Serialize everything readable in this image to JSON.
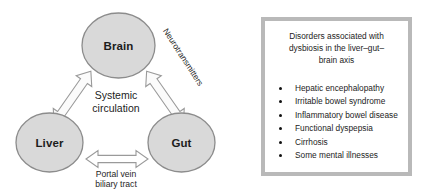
{
  "figure": {
    "diagram": {
      "nodes": [
        {
          "id": "brain",
          "label": "Brain"
        },
        {
          "id": "liver",
          "label": "Liver"
        },
        {
          "id": "gut",
          "label": "Gut"
        }
      ],
      "center_label": {
        "line1": "Systemic",
        "line2": "circulation"
      },
      "edges": [
        {
          "id": "brain-gut",
          "label": "Neurotransmitters",
          "style": "double-headed-block-arrow"
        },
        {
          "id": "liver-gut",
          "label_line1": "Portal vein",
          "label_line2": "biliary tract",
          "style": "double-headed-block-arrow"
        },
        {
          "id": "liver-brain",
          "label": "",
          "style": "double-headed-block-arrow"
        }
      ],
      "colors": {
        "node_fill": "#d9d9d9",
        "node_stroke": "#8c8c8c",
        "arrow_fill": "#fbfbfb",
        "arrow_stroke": "#9a9a9a",
        "text": "#1c1c1c"
      }
    },
    "panel": {
      "title": "Disorders associated with dysbiosis in the liver–gut–brain axis",
      "title_lines": [
        "Disorders associated with",
        "dysbiosis in the liver–gut–",
        "brain axis"
      ],
      "items": [
        "Hepatic encephalopathy",
        "Irritable bowel syndrome",
        "Inflammatory bowel disease",
        "Functional dyspepsia",
        "Cirrhosis",
        "Some mental illnesses"
      ],
      "colors": {
        "border": "#b9b9b9",
        "background": "#ffffff",
        "text": "#1c1c1c",
        "bullet": "#111111"
      }
    }
  }
}
